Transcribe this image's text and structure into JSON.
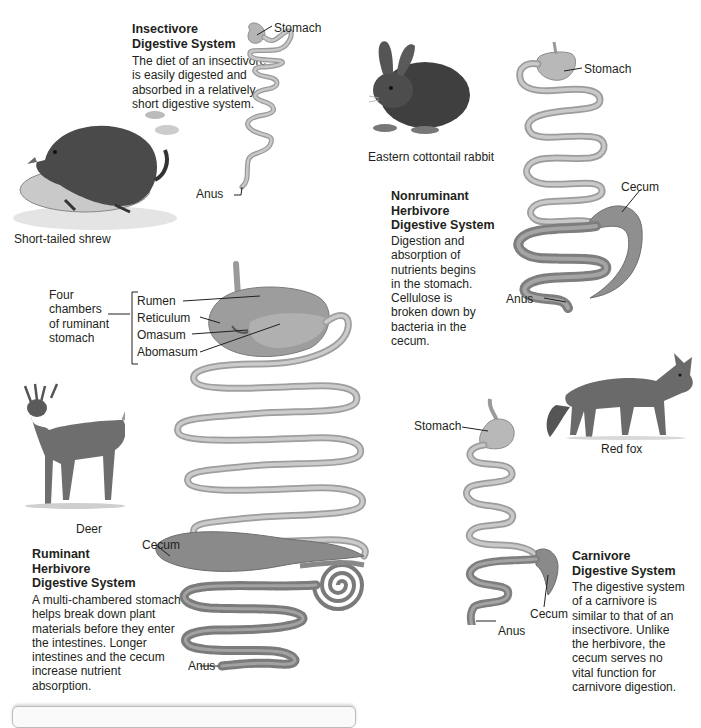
{
  "figure": {
    "top_text_fragment": "",
    "sections": {
      "insectivore": {
        "title_line1": "Insectivore",
        "title_line2": "Digestive System",
        "body": [
          "The diet of an insectivore",
          "is easily digested and",
          "absorbed in a relatively",
          "short digestive system."
        ],
        "animal_caption": "Short-tailed shrew",
        "labels": {
          "stomach": "Stomach",
          "anus": "Anus"
        }
      },
      "nonruminant": {
        "title_line1": "Nonruminant",
        "title_line2": "Herbivore",
        "title_line3": "Digestive System",
        "body": [
          "Digestion and",
          "absorption of",
          "nutrients begins",
          "in the stomach.",
          "Cellulose is",
          "broken down by",
          "bacteria in the",
          "cecum."
        ],
        "animal_caption": "Eastern cottontail rabbit",
        "labels": {
          "stomach": "Stomach",
          "cecum": "Cecum",
          "anus": "Anus"
        }
      },
      "ruminant": {
        "title_line1": "Ruminant",
        "title_line2": "Herbivore",
        "title_line3": "Digestive System",
        "body": [
          "A multi-chambered stomach",
          "helps break down plant",
          "materials before they enter",
          "the intestines. Longer",
          "intestines and the cecum",
          "increase nutrient",
          "absorption."
        ],
        "animal_caption": "Deer",
        "chambers_caption": [
          "Four",
          "chambers",
          "of ruminant",
          "stomach"
        ],
        "chambers": [
          "Rumen",
          "Reticulum",
          "Omasum",
          "Abomasum"
        ],
        "labels": {
          "cecum": "Cecum",
          "anus": "Anus"
        }
      },
      "carnivore": {
        "title_line1": "Carnivore",
        "title_line2": "Digestive System",
        "body": [
          "The digestive system",
          "of a carnivore is",
          "similar to that of an",
          "insectivore. Unlike",
          "the herbivore, the",
          "cecum serves no",
          "vital function for",
          "carnivore digestion."
        ],
        "animal_caption": "Red fox",
        "labels": {
          "stomach": "Stomach",
          "cecum": "Cecum",
          "anus": "Anus"
        }
      }
    },
    "colors": {
      "text": "#231f20",
      "gut_fill": "#b8b8b8",
      "gut_stroke": "#8a8a8a",
      "gut_dark": "#7d7d7d",
      "leader": "#231f20"
    }
  }
}
